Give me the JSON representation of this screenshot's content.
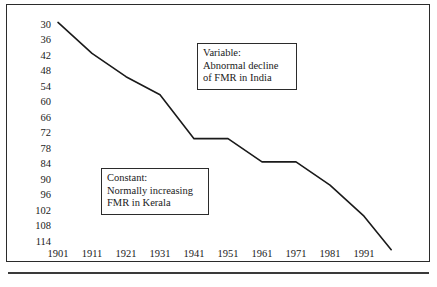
{
  "chart_data": {
    "type": "line",
    "title": "",
    "xlabel": "",
    "ylabel": "",
    "x": [
      1901,
      1911,
      1921,
      1931,
      1941,
      1951,
      1961,
      1971,
      1981,
      1991,
      1999
    ],
    "series": [
      {
        "name": "FMR in India",
        "values": [
          29,
          41,
          50,
          57,
          74,
          74,
          83,
          83,
          92,
          104,
          117
        ]
      }
    ],
    "y_tick_labels": [
      "30",
      "36",
      "42",
      "48",
      "54",
      "60",
      "66",
      "72",
      "78",
      "84",
      "90",
      "96",
      "102",
      "108",
      "114"
    ],
    "y_ticks": [
      30,
      36,
      42,
      48,
      54,
      60,
      66,
      72,
      78,
      84,
      90,
      96,
      102,
      108,
      114
    ],
    "x_tick_labels": [
      "1901",
      "1911",
      "1921",
      "1931",
      "1941",
      "1951",
      "1961",
      "1971",
      "1981",
      "1991"
    ],
    "x_ticks": [
      1901,
      1911,
      1921,
      1931,
      1941,
      1951,
      1961,
      1971,
      1981,
      1991
    ],
    "ylim": [
      30,
      118
    ],
    "xlim": [
      1901,
      1999
    ],
    "y_axis_inverted": true,
    "grid": false,
    "legend": "none",
    "line_color": "#1a1a1a",
    "annotations": [
      {
        "id": "variable",
        "lines": [
          "Variable:",
          "Abnormal decline",
          "of FMR in India"
        ]
      },
      {
        "id": "constant",
        "lines": [
          "Constant:",
          "Normally increasing",
          "FMR in Kerala"
        ]
      }
    ]
  }
}
